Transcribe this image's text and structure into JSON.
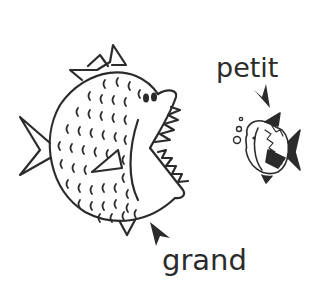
{
  "labels": {
    "small": "petit",
    "big": "grand"
  },
  "illustration": {
    "big_fish": "big-fish-open-mouth",
    "small_fish": "small-fish-with-bubbles",
    "arrows": [
      "arrow-to-small-fish",
      "arrow-to-big-fish"
    ]
  },
  "colors": {
    "ink": "#2b2b2b",
    "background": "#ffffff"
  }
}
